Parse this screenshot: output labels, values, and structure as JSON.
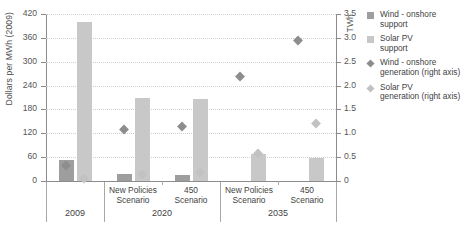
{
  "axes": {
    "left_title": "Dollars per MWh (2009)",
    "right_title": "TWh",
    "left_ticks": [
      "0",
      "60",
      "120",
      "180",
      "240",
      "300",
      "360",
      "420"
    ],
    "right_ticks": [
      "0",
      "0.5",
      "1.0",
      "1.5",
      "2.0",
      "2.5",
      "3.0",
      "3.5"
    ]
  },
  "legend": {
    "items": [
      {
        "name": "wind-support-swatch",
        "label": "Wind - onshore\nsupport",
        "color": "#9e9e9e",
        "shape": "square"
      },
      {
        "name": "solar-support-swatch",
        "label": "Solar PV\nsupport",
        "color": "#c8c8c8",
        "shape": "square"
      },
      {
        "name": "wind-generation-swatch",
        "label": "Wind - onshore\ngeneration (right axis)",
        "color": "#8d8d8d",
        "shape": "diamond"
      },
      {
        "name": "solar-generation-swatch",
        "label": "Solar PV\ngeneration (right axis)",
        "color": "#c2c2c2",
        "shape": "diamond"
      }
    ]
  },
  "categories": [
    {
      "year": "2009",
      "scenarios": [
        "",
        ""
      ]
    },
    {
      "year": "2020",
      "scenarios": [
        "New Policies\nScenario",
        "450\nScenario"
      ]
    },
    {
      "year": "2035",
      "scenarios": [
        "New Policies\nScenario",
        "450\nScenario"
      ]
    }
  ],
  "chart_data": {
    "type": "bar",
    "title": "",
    "xlabel": "",
    "ylabel": "Dollars per MWh (2009)",
    "ylabel_right": "TWh",
    "ylim": [
      0,
      420
    ],
    "ylim_right": [
      0,
      3.5
    ],
    "grid": true,
    "legend_position": "right",
    "categories": [
      "2009",
      "2020 New Policies Scenario",
      "2020 450 Scenario",
      "2035 New Policies Scenario",
      "2035 450 Scenario"
    ],
    "series": [
      {
        "name": "Wind - onshore support",
        "axis": "left",
        "type": "bar",
        "color": "#9e9e9e",
        "values": [
          53,
          18,
          15,
          0,
          0
        ]
      },
      {
        "name": "Solar PV support",
        "axis": "left",
        "type": "bar",
        "color": "#c8c8c8",
        "values": [
          400,
          210,
          207,
          67,
          57
        ]
      },
      {
        "name": "Wind - onshore generation (right axis)",
        "axis": "right",
        "type": "scatter",
        "color": "#8d8d8d",
        "values": [
          0.33,
          1.07,
          1.15,
          2.2,
          2.95
        ]
      },
      {
        "name": "Solar PV generation (right axis)",
        "axis": "right",
        "type": "scatter",
        "color": "#c2c2c2",
        "values": [
          0.05,
          0.14,
          0.18,
          0.58,
          1.2
        ]
      }
    ]
  }
}
